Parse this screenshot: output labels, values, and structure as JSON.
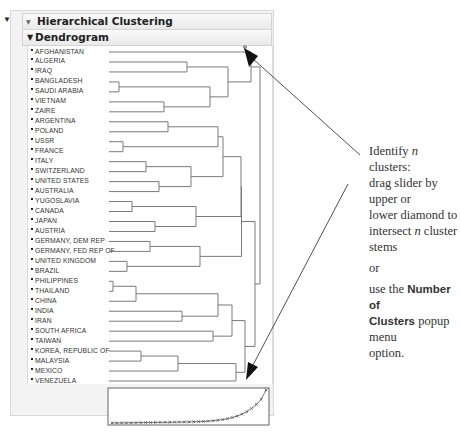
{
  "header": {
    "title": "Hierarchical Clustering",
    "subtitle": "Dendrogram"
  },
  "leaves": [
    "AFGHANISTAN",
    "ALGERIA",
    "IRAQ",
    "BANGLADESH",
    "SAUDI ARABIA",
    "VIETNAM",
    "ZAIRE",
    "ARGENTINA",
    "POLAND",
    "USSR",
    "FRANCE",
    "ITALY",
    "SWITZERLAND",
    "UNITED STATES",
    "AUSTRALIA",
    "YUGOSLAVIA",
    "CANADA",
    "JAPAN",
    "AUSTRIA",
    "GERMANY, DEM REP",
    "GERMANY, FED REP OF",
    "UNITED KINGDOM",
    "BRAZIL",
    "PHILIPPINES",
    "THAILAND",
    "CHINA",
    "INDIA",
    "IRAN",
    "SOUTH AFRICA",
    "TAIWAN",
    "KOREA, REPUBLIC OF",
    "MALAYSIA",
    "MEXICO",
    "VENEZUELA"
  ],
  "annotation": {
    "line1_pre": "Identify ",
    "line1_n": "n",
    "line1_post": " clusters:",
    "line2": "drag slider by upper or",
    "line3": "lower diamond to",
    "line4_pre": "intersect ",
    "line4_n": "n",
    "line4_post": " cluster",
    "line5": "stems",
    "or": "or",
    "use_pre": "use the ",
    "use_bold1": "Number of",
    "use_bold2": "Clusters",
    "use_post": " popup menu",
    "option": "option."
  },
  "colors": {
    "tree_line": "#7a7a7a",
    "arrow": "#222222",
    "panel_bg": "#f3f3f3",
    "header_bg": "#ececec"
  },
  "scree": {
    "points": 33,
    "marker": "x"
  }
}
